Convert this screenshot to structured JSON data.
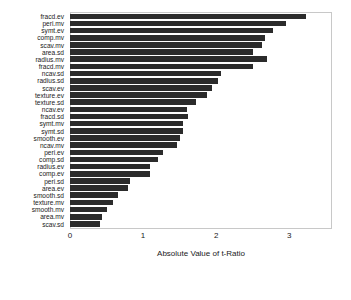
{
  "chart_data": {
    "type": "bar",
    "orientation": "horizontal",
    "title": "",
    "xlabel": "Absolute Value of t-Ratio",
    "ylabel": "",
    "xlim": [
      0,
      3.57
    ],
    "xticks": [
      0,
      1,
      2,
      3
    ],
    "xticklabels": [
      "0",
      "1",
      "2",
      "3"
    ],
    "grid": false,
    "legend": null,
    "bar_color": "#2b2b2b",
    "frame_color": "#c8c8c8",
    "categories": [
      "fracd.ev",
      "peri.mv",
      "symt.ev",
      "comp.mv",
      "scav.mv",
      "area.sd",
      "radius.mv",
      "fracd.mv",
      "ncav.sd",
      "radius.sd",
      "scav.ev",
      "texture.ev",
      "texture.sd",
      "ncav.ev",
      "fracd.sd",
      "symt.mv",
      "symt.sd",
      "smooth.ev",
      "ncav.mv",
      "peri.ev",
      "comp.sd",
      "radius.ev",
      "comp.ev",
      "peri.sd",
      "area.ev",
      "smooth.sd",
      "texture.mv",
      "smooth.mv",
      "area.mv",
      "scav.sd"
    ],
    "values": [
      3.23,
      2.96,
      2.77,
      2.67,
      2.62,
      2.5,
      2.69,
      2.5,
      2.07,
      2.02,
      1.94,
      1.88,
      1.72,
      1.6,
      1.61,
      1.55,
      1.55,
      1.5,
      1.46,
      1.27,
      1.2,
      1.1,
      1.1,
      0.82,
      0.79,
      0.65,
      0.59,
      0.5,
      0.44,
      0.41
    ]
  },
  "axis": {
    "x_title": "Absolute Value of t-Ratio",
    "tick_labels": [
      "0",
      "1",
      "2",
      "3"
    ]
  }
}
